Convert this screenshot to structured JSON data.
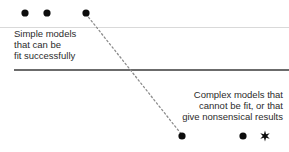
{
  "figure": {
    "background_color": "#ffffff",
    "width": 289,
    "height": 152
  },
  "captions": {
    "simple": "Simple models\nthat can be\nfit successfully",
    "complex": "Complex models that\ncannot be fit, or that\ngive nonsensical results"
  },
  "chart_data": {
    "type": "scatter",
    "title": "",
    "subtitle": "",
    "xlabel": "",
    "ylabel": "",
    "xlim": [
      0,
      289
    ],
    "ylim": [
      0,
      152
    ],
    "grid": false,
    "legend": null,
    "annotations": [
      {
        "name": "simple-models-label",
        "text": "Simple models that can be fit successfully",
        "x": 14,
        "y": 28,
        "align": "left",
        "color": "#2b2b2b"
      },
      {
        "name": "complex-models-label",
        "text": "Complex models that cannot be fit, or that give nonsensical results",
        "x": 283,
        "y": 89,
        "align": "right",
        "color": "#2b2b2b"
      }
    ],
    "reference_lines": [
      {
        "name": "upper-boundary-line",
        "orientation": "horizontal",
        "y": 27.5,
        "x_start": 0,
        "x_end": 289,
        "color": "#d9d9d9",
        "width": 1.4,
        "style": "solid"
      },
      {
        "name": "lower-boundary-line",
        "orientation": "horizontal",
        "y": 70,
        "x_start": 14,
        "x_end": 289,
        "color": "#6b6b6b",
        "width": 1.1,
        "style": "solid"
      }
    ],
    "connector": {
      "name": "trend-connector",
      "style": "dotted",
      "color": "#8c8c8c",
      "width": 1.3,
      "dash": "1.6 2.6",
      "from": {
        "x": 86,
        "y": 14
      },
      "to": {
        "x": 182,
        "y": 135
      }
    },
    "series": [
      {
        "name": "simple-models-points",
        "marker": "circle",
        "color": "#0d0d0d",
        "size": 3.6,
        "points": [
          {
            "x": 25,
            "y": 13
          },
          {
            "x": 47,
            "y": 13
          },
          {
            "x": 86,
            "y": 13
          }
        ]
      },
      {
        "name": "complex-models-points",
        "marker": "circle",
        "color": "#0d0d0d",
        "size": 3.6,
        "points": [
          {
            "x": 182,
            "y": 136
          },
          {
            "x": 243,
            "y": 136
          }
        ]
      },
      {
        "name": "special-point",
        "marker": "star",
        "color": "#0d0d0d",
        "size": 5.4,
        "points": [
          {
            "x": 265,
            "y": 136
          }
        ]
      }
    ]
  }
}
